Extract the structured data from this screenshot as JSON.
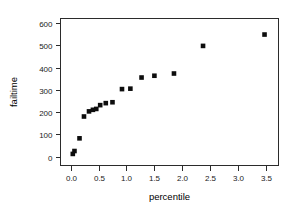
{
  "chart_data": {
    "type": "scatter",
    "title": "",
    "xlabel": "percentile",
    "ylabel": "failtime",
    "xlim": [
      -0.18,
      3.72
    ],
    "ylim": [
      -40,
      620
    ],
    "grid": false,
    "legend": null,
    "xticks": [
      "0.0",
      "0.5",
      "1.0",
      "1.5",
      "2.0",
      "2.5",
      "3.0",
      "3.5"
    ],
    "xtick_values": [
      0.0,
      0.5,
      1.0,
      1.5,
      2.0,
      2.5,
      3.0,
      3.5
    ],
    "yticks": [
      "0",
      "100",
      "200",
      "300",
      "400",
      "500",
      "600"
    ],
    "ytick_values": [
      0,
      100,
      200,
      300,
      400,
      500,
      600
    ],
    "marker": "filled-square",
    "marker_color": "#0d0d0d",
    "x": [
      0.04,
      0.07,
      0.16,
      0.24,
      0.33,
      0.4,
      0.46,
      0.53,
      0.63,
      0.75,
      0.92,
      1.07,
      1.27,
      1.5,
      1.85,
      2.37,
      3.47
    ],
    "y": [
      12,
      25,
      82,
      180,
      203,
      210,
      214,
      231,
      240,
      244,
      303,
      305,
      355,
      363,
      373,
      497,
      548
    ],
    "points": [
      {
        "percentile": 0.04,
        "failtime": 12
      },
      {
        "percentile": 0.07,
        "failtime": 25
      },
      {
        "percentile": 0.16,
        "failtime": 82
      },
      {
        "percentile": 0.24,
        "failtime": 180
      },
      {
        "percentile": 0.33,
        "failtime": 203
      },
      {
        "percentile": 0.4,
        "failtime": 210
      },
      {
        "percentile": 0.46,
        "failtime": 214
      },
      {
        "percentile": 0.53,
        "failtime": 231
      },
      {
        "percentile": 0.63,
        "failtime": 240
      },
      {
        "percentile": 0.75,
        "failtime": 244
      },
      {
        "percentile": 0.92,
        "failtime": 303
      },
      {
        "percentile": 1.07,
        "failtime": 305
      },
      {
        "percentile": 1.27,
        "failtime": 355
      },
      {
        "percentile": 1.5,
        "failtime": 363
      },
      {
        "percentile": 1.85,
        "failtime": 373
      },
      {
        "percentile": 2.37,
        "failtime": 497
      },
      {
        "percentile": 3.47,
        "failtime": 548
      }
    ]
  },
  "colors": {
    "axis": "#2b2b2b",
    "marker": "#0d0d0d",
    "background": "#ffffff",
    "text": "#1a1a1a"
  }
}
